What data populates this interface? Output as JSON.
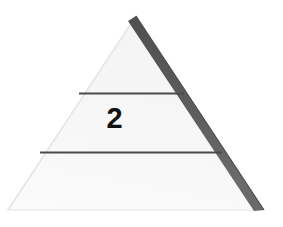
{
  "figure": {
    "type": "pyramid",
    "canvas": {
      "width": 283,
      "height": 227
    },
    "background_color": "#ffffff"
  },
  "pyramid": {
    "fill_color": "#f7f7f7",
    "shadow_edge_color": "#5a5a5a",
    "faint_edge_color": "#ededed",
    "divider_color": "#4a4a4a",
    "apex": {
      "x": 136,
      "y": 16
    },
    "base_left": {
      "x": 8,
      "y": 210
    },
    "base_right": {
      "x": 264,
      "y": 210
    },
    "dividers": [
      {
        "name": "upper-divider",
        "y": 93,
        "x_start": 79,
        "x_end": 184
      },
      {
        "name": "lower-divider",
        "y": 152,
        "x_start": 40,
        "x_end": 222
      }
    ],
    "levels": [
      {
        "index": 1,
        "label": "",
        "position": "top"
      },
      {
        "index": 2,
        "label": "2",
        "position": "middle"
      },
      {
        "index": 3,
        "label": "",
        "position": "bottom"
      }
    ]
  },
  "labels": {
    "level_2": "2"
  }
}
